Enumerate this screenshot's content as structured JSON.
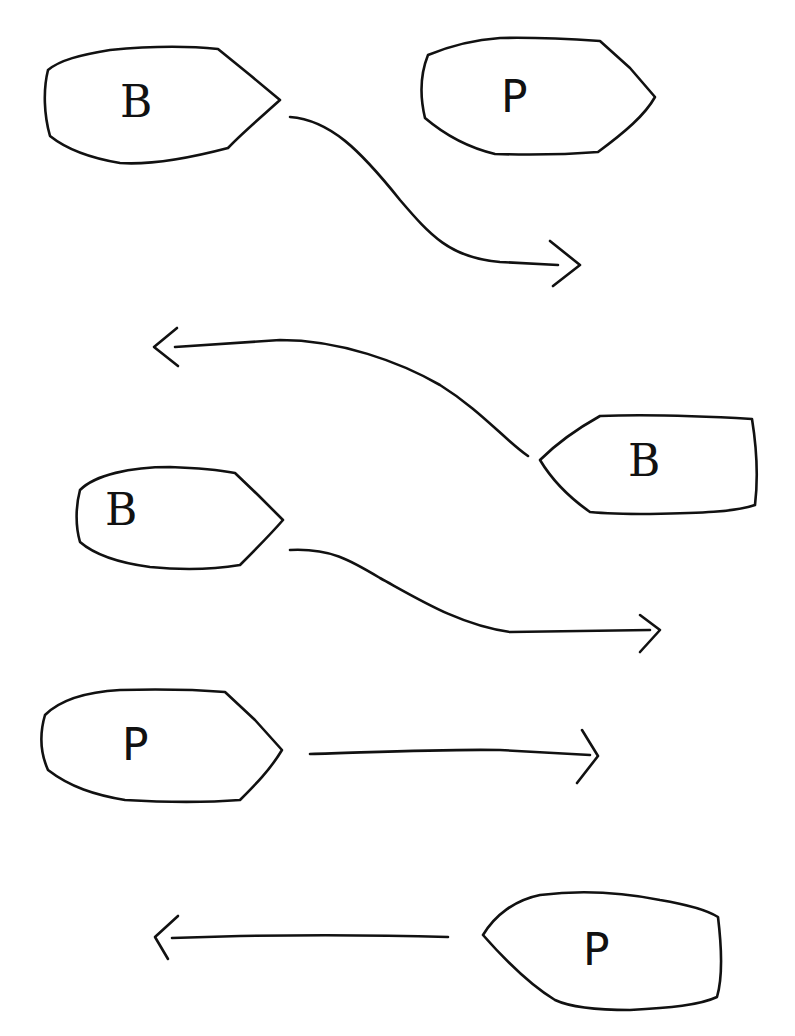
{
  "diagram": {
    "background": "#ffffff",
    "ink": "#111111",
    "boats": [
      {
        "id": "boat-1",
        "label": "B",
        "facing": "right",
        "row": 1
      },
      {
        "id": "boat-2",
        "label": "P",
        "facing": "right",
        "row": 1
      },
      {
        "id": "boat-3",
        "label": "B",
        "facing": "left",
        "row": 2
      },
      {
        "id": "boat-4",
        "label": "B",
        "facing": "right",
        "row": 3
      },
      {
        "id": "boat-5",
        "label": "P",
        "facing": "right",
        "row": 4
      },
      {
        "id": "boat-6",
        "label": "P",
        "facing": "left",
        "row": 5
      }
    ],
    "arrows": [
      {
        "id": "arrow-1",
        "from": "boat-1",
        "direction": "right",
        "shape": "curved-down"
      },
      {
        "id": "arrow-2",
        "from": "boat-3",
        "direction": "left",
        "shape": "curved-up"
      },
      {
        "id": "arrow-3",
        "from": "boat-4",
        "direction": "right",
        "shape": "curved-down"
      },
      {
        "id": "arrow-4",
        "from": "boat-5",
        "direction": "right",
        "shape": "straight"
      },
      {
        "id": "arrow-5",
        "from": "boat-6",
        "direction": "left",
        "shape": "straight"
      }
    ]
  }
}
